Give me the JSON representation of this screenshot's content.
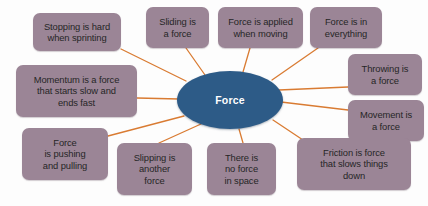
{
  "diagram": {
    "title": "Force",
    "type": "mind-map",
    "canvas": {
      "width": 428,
      "height": 206,
      "background": "#fdfdfd"
    },
    "center": {
      "label": "Force",
      "fill": "#2d5b87",
      "text_color": "#ffffff",
      "cx": 230,
      "cy": 100,
      "rx": 53,
      "ry": 29
    },
    "style": {
      "node_fill": "#9b8596",
      "node_text_color": "#262626",
      "edge_color": "#d97b32",
      "edge_width": 1.3,
      "node_radius": 7
    },
    "nodes": [
      {
        "id": "stopping-is-hard-when-sprinting",
        "label": "Stopping is hard\nwhen sprinting",
        "x": 33,
        "y": 13,
        "w": 88,
        "h": 38,
        "anchor_x": 121,
        "anchor_y": 49,
        "edge_end_x": 186,
        "edge_end_y": 81
      },
      {
        "id": "sliding-is-a-force",
        "label": "Sliding is\na force",
        "x": 146,
        "y": 7,
        "w": 63,
        "h": 41,
        "anchor_x": 186,
        "anchor_y": 48,
        "edge_end_x": 205,
        "edge_end_y": 75
      },
      {
        "id": "force-is-applied-when-moving",
        "label": "Force is applied\nwhen moving",
        "x": 218,
        "y": 7,
        "w": 85,
        "h": 41,
        "anchor_x": 250,
        "anchor_y": 48,
        "edge_end_x": 243,
        "edge_end_y": 72
      },
      {
        "id": "force-is-in-everything",
        "label": "Force is in\neverything",
        "x": 310,
        "y": 7,
        "w": 72,
        "h": 41,
        "anchor_x": 318,
        "anchor_y": 48,
        "edge_end_x": 272,
        "edge_end_y": 80
      },
      {
        "id": "momentum-is-a-force-that-starts-slow-and-ends-fast",
        "label": "Momentum is a force\nthat starts slow and\nends fast",
        "x": 16,
        "y": 65,
        "w": 121,
        "h": 52,
        "anchor_x": 137,
        "anchor_y": 98,
        "edge_end_x": 179,
        "edge_end_y": 99
      },
      {
        "id": "throwing-is-a-force",
        "label": "Throwing is\na force",
        "x": 348,
        "y": 54,
        "w": 74,
        "h": 41,
        "anchor_x": 348,
        "anchor_y": 87,
        "edge_end_x": 279,
        "edge_end_y": 90
      },
      {
        "id": "movement-is-a-force",
        "label": "Movement is\na force",
        "x": 348,
        "y": 100,
        "w": 76,
        "h": 41,
        "anchor_x": 348,
        "anchor_y": 110,
        "edge_end_x": 281,
        "edge_end_y": 102
      },
      {
        "id": "force-is-pushing-and-pulling",
        "label": "Force\nis pushing\nand pulling",
        "x": 22,
        "y": 128,
        "w": 86,
        "h": 52,
        "anchor_x": 108,
        "anchor_y": 136,
        "edge_end_x": 184,
        "edge_end_y": 116
      },
      {
        "id": "slipping-is-another-force",
        "label": "Slipping is\nanother\nforce",
        "x": 117,
        "y": 143,
        "w": 75,
        "h": 52,
        "anchor_x": 159,
        "anchor_y": 143,
        "edge_end_x": 201,
        "edge_end_y": 124
      },
      {
        "id": "there-is-no-force-in-space",
        "label": "There is\nno force\nin space",
        "x": 207,
        "y": 143,
        "w": 69,
        "h": 52,
        "anchor_x": 243,
        "anchor_y": 143,
        "edge_end_x": 239,
        "edge_end_y": 129
      },
      {
        "id": "friction-is-force-that-slows-things-down",
        "label": "Friction is force\nthat slows things\ndown",
        "x": 297,
        "y": 138,
        "w": 114,
        "h": 52,
        "anchor_x": 303,
        "anchor_y": 140,
        "edge_end_x": 273,
        "edge_end_y": 120
      }
    ]
  }
}
